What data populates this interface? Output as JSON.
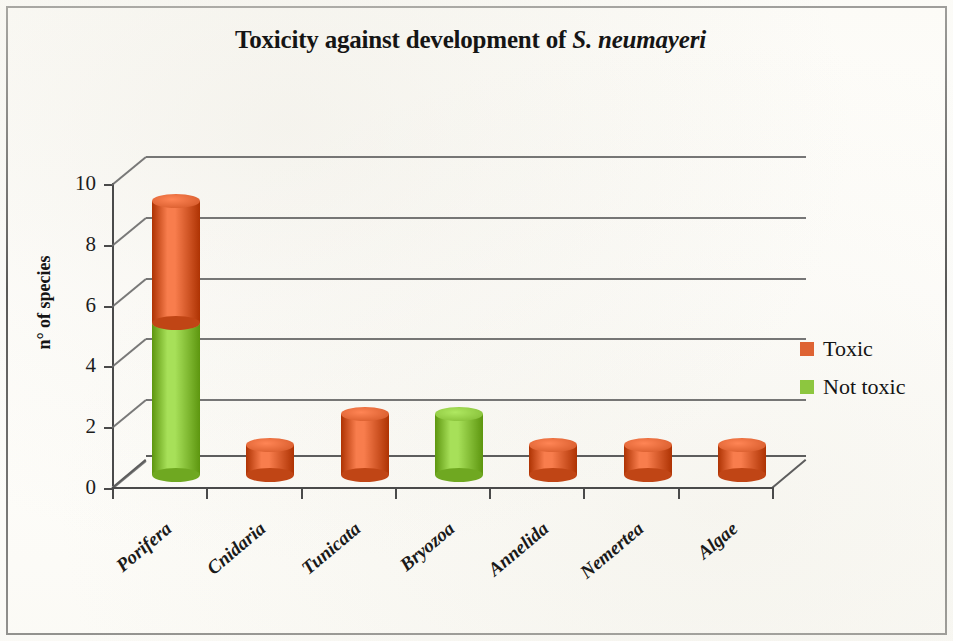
{
  "chart_data": {
    "type": "bar",
    "subtype": "stacked-cylinder-3d",
    "title_plain": "Toxicity against development of S. neumayeri",
    "title_prefix": "Toxicity against development of ",
    "title_italic": "S. neumayeri",
    "xlabel": "",
    "ylabel": "n° of species",
    "categories": [
      "Porifera",
      "Cnidaria",
      "Tunicata",
      "Bryozoa",
      "Annelida",
      "Nemertea",
      "Algae"
    ],
    "series": [
      {
        "name": "Not toxic",
        "color": "#8DC63F",
        "values": [
          5,
          0,
          0,
          2,
          0,
          0,
          0
        ]
      },
      {
        "name": "Toxic",
        "color": "#DE6333",
        "values": [
          4,
          1,
          2,
          0,
          1,
          1,
          1
        ]
      }
    ],
    "stack_order": [
      "Not toxic",
      "Toxic"
    ],
    "totals": [
      9,
      1,
      2,
      2,
      1,
      1,
      1
    ],
    "ylim": [
      0,
      10
    ],
    "yticks": [
      0,
      2,
      4,
      6,
      8,
      10
    ],
    "ytick_labels": [
      "0",
      "2",
      "4",
      "6",
      "8",
      "10"
    ],
    "grid": true,
    "grid_axis": "y",
    "legend_position": "right",
    "legend_entries": [
      {
        "label": "Toxic",
        "color": "#DE6333"
      },
      {
        "label": "Not toxic",
        "color": "#8DC63F"
      }
    ]
  },
  "colors": {
    "toxic": "#DE6333",
    "not_toxic": "#8DC63F",
    "axis": "#4a4a4a",
    "grid": "#6a6a6a",
    "text": "#151515",
    "frame": "#1a1a1a",
    "background": "#fffefb"
  }
}
